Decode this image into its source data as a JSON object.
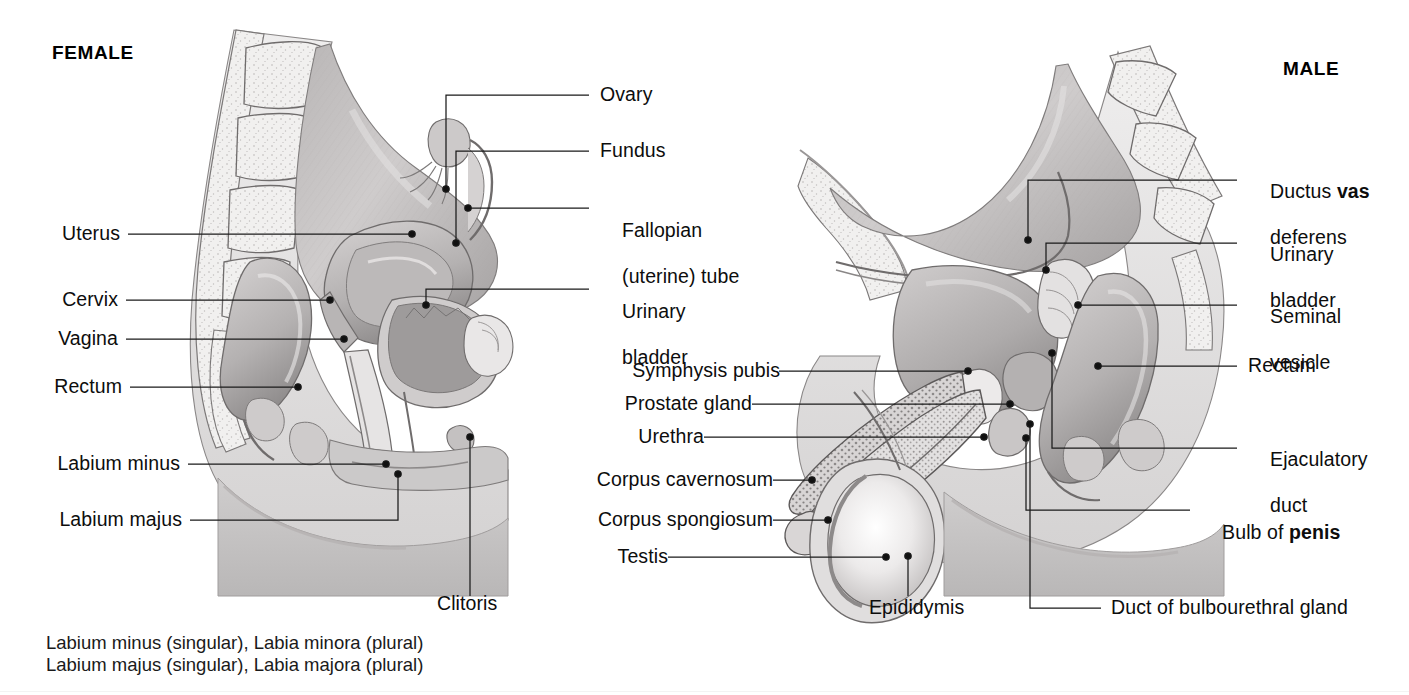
{
  "figure": {
    "kind": "anatomy-diagram",
    "background_color": "#ffffff",
    "ink_color": "#1a1a1a"
  },
  "titles": {
    "female": "FEMALE",
    "male": "MALE"
  },
  "female_labels": [
    {
      "id": "uterus",
      "text": "Uterus",
      "side": "left"
    },
    {
      "id": "cervix",
      "text": "Cervix",
      "side": "left"
    },
    {
      "id": "vagina",
      "text": "Vagina",
      "side": "left"
    },
    {
      "id": "rectum",
      "text": "Rectum",
      "side": "left"
    },
    {
      "id": "labium-minus",
      "text": "Labium minus",
      "side": "left"
    },
    {
      "id": "labium-majus",
      "text": "Labium majus",
      "side": "left"
    },
    {
      "id": "ovary",
      "text": "Ovary",
      "side": "right"
    },
    {
      "id": "fundus",
      "text": "Fundus",
      "side": "right"
    },
    {
      "id": "fallopian",
      "text": "Fallopian\n(uterine) tube",
      "side": "right"
    },
    {
      "id": "urinary-bladder-f",
      "text": "Urinary\nbladder",
      "side": "right"
    },
    {
      "id": "clitoris",
      "text": "Clitoris",
      "side": "bottom"
    }
  ],
  "male_labels": [
    {
      "id": "symphysis-pubis",
      "text": "Symphysis pubis",
      "side": "left"
    },
    {
      "id": "prostate-gland",
      "text": "Prostate gland",
      "side": "left"
    },
    {
      "id": "urethra",
      "text": "Urethra",
      "side": "left"
    },
    {
      "id": "corpus-cavernosum",
      "text": "Corpus cavernosum",
      "side": "left"
    },
    {
      "id": "corpus-spongiosum",
      "text": "Corpus spongiosum",
      "side": "left"
    },
    {
      "id": "testis",
      "text": "Testis",
      "side": "left"
    },
    {
      "id": "ductus-vas-deferens",
      "text": "Ductus vas\ndeferens",
      "side": "right",
      "bold_word": "vas"
    },
    {
      "id": "urinary-bladder-m",
      "text": "Urinary\nbladder",
      "side": "right"
    },
    {
      "id": "seminal-vesicle",
      "text": "Seminal\nvesicle",
      "side": "right"
    },
    {
      "id": "rectum-m",
      "text": "Rectum",
      "side": "right"
    },
    {
      "id": "ejaculatory-duct",
      "text": "Ejaculatory\nduct",
      "side": "right"
    },
    {
      "id": "bulb-of-penis",
      "text": "Bulb of penis",
      "side": "right",
      "bold_word": "penis"
    },
    {
      "id": "epididymis",
      "text": "Epididymis",
      "side": "bottom"
    },
    {
      "id": "duct-bulbourethral",
      "text": "Duct of bulbourethral gland",
      "side": "bottom"
    }
  ],
  "label_text": {
    "uterus": "Uterus",
    "cervix": "Cervix",
    "vagina": "Vagina",
    "rectum": "Rectum",
    "labium_minus": "Labium minus",
    "labium_majus": "Labium majus",
    "ovary": "Ovary",
    "fundus": "Fundus",
    "fallopian_line1": "Fallopian",
    "fallopian_line2": "(uterine) tube",
    "urinary_line1": "Urinary",
    "urinary_line2": "bladder",
    "clitoris": "Clitoris",
    "symphysis_pubis": "Symphysis pubis",
    "prostate_gland": "Prostate gland",
    "urethra": "Urethra",
    "corpus_cavernosum": "Corpus cavernosum",
    "corpus_spongiosum": "Corpus spongiosum",
    "testis": "Testis",
    "ductus_line1_a": "Ductus ",
    "ductus_line1_b": "vas",
    "ductus_line2": "deferens",
    "urinary_m_line1": "Urinary",
    "urinary_m_line2": "bladder",
    "seminal_line1": "Seminal",
    "seminal_line2": "vesicle",
    "rectum_m": "Rectum",
    "ejaculatory_line1": "Ejaculatory",
    "ejaculatory_line2": "duct",
    "bulb_a": "Bulb of ",
    "bulb_b": "penis",
    "epididymis": "Epididymis",
    "duct_bulbourethral": "Duct of bulbourethral gland"
  },
  "footnotes": {
    "line1": "Labium minus (singular), Labia minora (plural)",
    "line2": "Labium majus (singular), Labia majora (plural)"
  },
  "palette": {
    "tissue_light": "#eceaea",
    "tissue_mid": "#c9c6c6",
    "tissue_dark": "#a3a0a0",
    "organ_shadow": "#8d8a8a",
    "bone_fill": "#f2f1f0",
    "outline": "#6b6868",
    "leader": "#1a1a1a"
  }
}
